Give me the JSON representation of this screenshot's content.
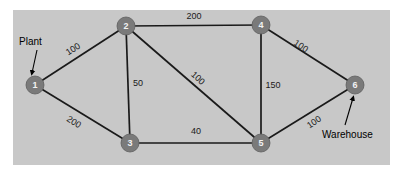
{
  "figure": {
    "type": "network-diagram",
    "panel": {
      "background_color": "#c8c8c8",
      "x": 13,
      "y": 10,
      "width": 377,
      "height": 155
    },
    "node_color": "#7a7a7a",
    "node_label_color": "#f2f2f2",
    "edge_color": "#1a1a1a",
    "nodes": [
      {
        "id": "1",
        "label": "1",
        "x": 35,
        "y": 85,
        "r": 9
      },
      {
        "id": "2",
        "label": "2",
        "x": 126,
        "y": 26,
        "r": 9
      },
      {
        "id": "3",
        "label": "3",
        "x": 130,
        "y": 143,
        "r": 9
      },
      {
        "id": "4",
        "label": "4",
        "x": 261,
        "y": 25,
        "r": 9
      },
      {
        "id": "5",
        "label": "5",
        "x": 261,
        "y": 143,
        "r": 9
      },
      {
        "id": "6",
        "label": "6",
        "x": 355,
        "y": 85,
        "r": 9
      }
    ],
    "edges": [
      {
        "from": "1",
        "to": "2",
        "label": "100",
        "label_x": 73,
        "label_y": 49,
        "label_rotation": -33
      },
      {
        "from": "1",
        "to": "3",
        "label": "200",
        "label_x": 74,
        "label_y": 122,
        "label_rotation": 32
      },
      {
        "from": "2",
        "to": "4",
        "label": "200",
        "label_x": 194,
        "label_y": 16,
        "label_rotation": 0
      },
      {
        "from": "2",
        "to": "3",
        "label": "50",
        "label_x": 138,
        "label_y": 83,
        "label_rotation": 0
      },
      {
        "from": "2",
        "to": "5",
        "label": "100",
        "label_x": 198,
        "label_y": 78,
        "label_rotation": 42
      },
      {
        "from": "3",
        "to": "5",
        "label": "40",
        "label_x": 196,
        "label_y": 131,
        "label_rotation": 0
      },
      {
        "from": "4",
        "to": "5",
        "label": "150",
        "label_x": 273,
        "label_y": 85,
        "label_rotation": 0
      },
      {
        "from": "4",
        "to": "6",
        "label": "100",
        "label_x": 301,
        "label_y": 46,
        "label_rotation": 34
      },
      {
        "from": "5",
        "to": "6",
        "label": "100",
        "label_x": 314,
        "label_y": 122,
        "label_rotation": -34
      }
    ],
    "annotations": [
      {
        "id": "plant",
        "text": "Plant",
        "text_x": 19,
        "text_y": 41,
        "arrow_from_x": 37,
        "arrow_from_y": 50,
        "arrow_to_x": 32,
        "arrow_to_y": 73
      },
      {
        "id": "warehouse",
        "text": "Warehouse",
        "text_x": 322,
        "text_y": 134,
        "arrow_from_x": 345,
        "arrow_from_y": 125,
        "arrow_to_x": 353,
        "arrow_to_y": 98
      }
    ]
  }
}
